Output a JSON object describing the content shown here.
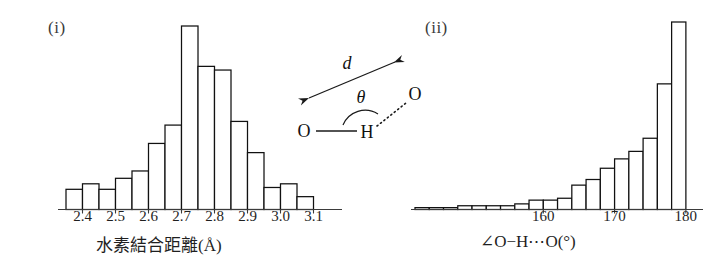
{
  "figure": {
    "panel_i_label": "(i)",
    "panel_ii_label": "(ii)"
  },
  "diagram": {
    "name": "hydrogen-bond-geometry",
    "distance_symbol": "d",
    "angle_symbol": "θ",
    "atom_donor_oxygen": "O",
    "atom_hydrogen": "H",
    "atom_acceptor_oxygen": "O"
  },
  "chart_data": [
    {
      "type": "bar",
      "name": "hydrogen-bond-distance-histogram",
      "panel": "(i)",
      "title": "",
      "xlabel": "水素結合距離(Å)",
      "ylabel": "",
      "xlim": [
        2.35,
        3.15
      ],
      "ylim": [
        0,
        100
      ],
      "grid": false,
      "legend": "none",
      "tick_labels": [
        "2.4",
        "2.5",
        "2.6",
        "2.7",
        "2.8",
        "2.9",
        "3.0",
        "3.1"
      ],
      "tick_values": [
        2.4,
        2.5,
        2.6,
        2.7,
        2.8,
        2.9,
        3.0,
        3.1
      ],
      "bin_width": 0.05,
      "categories": [
        "2.375",
        "2.425",
        "2.475",
        "2.525",
        "2.575",
        "2.625",
        "2.675",
        "2.725",
        "2.775",
        "2.825",
        "2.875",
        "2.925",
        "2.975",
        "3.025",
        "3.075"
      ],
      "values": [
        11,
        14,
        11,
        17,
        21,
        36,
        46,
        100,
        78,
        76,
        48,
        31,
        12,
        14,
        7
      ]
    },
    {
      "type": "bar",
      "name": "hydrogen-bond-angle-histogram",
      "panel": "(ii)",
      "title": "",
      "xlabel": "∠O−H⋯O(°)",
      "ylabel": "",
      "xlim": [
        142,
        181
      ],
      "ylim": [
        0,
        100
      ],
      "grid": false,
      "legend": "none",
      "tick_labels": [
        "160",
        "170",
        "180"
      ],
      "tick_values": [
        160,
        170,
        180
      ],
      "bin_width": 2,
      "categories": [
        "143",
        "145",
        "147",
        "149",
        "151",
        "153",
        "155",
        "157",
        "159",
        "161",
        "163",
        "165",
        "167",
        "169",
        "171",
        "173",
        "175",
        "177",
        "179"
      ],
      "values": [
        1,
        1,
        1,
        2,
        2,
        2,
        2,
        3,
        5,
        5,
        6,
        13,
        16,
        22,
        27,
        31,
        38,
        67,
        100
      ]
    }
  ]
}
